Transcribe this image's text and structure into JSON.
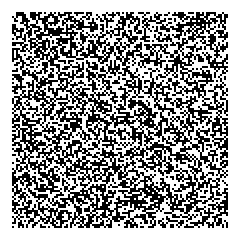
{
  "image": {
    "description": "Random binary noise pattern",
    "background_color": "#ffffff",
    "noise": {
      "x": 12,
      "y": 12,
      "width": 216,
      "height": 216,
      "cell_size": 2,
      "foreground_color": "#000000",
      "background_color": "#ffffff",
      "fill_ratio": 0.5,
      "seed": 1337
    }
  }
}
